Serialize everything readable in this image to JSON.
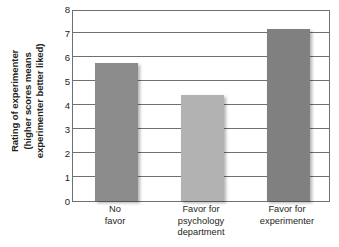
{
  "chart_data": {
    "type": "bar",
    "title": "",
    "xlabel": "",
    "ylabel": "Rating of experimenter (higher scores means experimenter better liked)",
    "ylabel_lines": [
      "Rating of experimenter",
      "(higher scores means",
      "experimenter better liked)"
    ],
    "categories": [
      "No favor",
      "Favor for psychology department",
      "Favor for experimenter"
    ],
    "category_lines": [
      [
        "No",
        "favor"
      ],
      [
        "Favor for",
        "psychology",
        "department"
      ],
      [
        "Favor for",
        "experimenter"
      ]
    ],
    "values": [
      5.75,
      4.4,
      7.15
    ],
    "ylim": [
      0,
      8
    ],
    "ytick_labels": [
      "8",
      "7",
      "6",
      "5",
      "4",
      "3",
      "2",
      "1",
      "0"
    ],
    "ytick_values": [
      8,
      7,
      6,
      5,
      4,
      3,
      2,
      1,
      0
    ],
    "grid": true,
    "legend": "none",
    "bar_colors": [
      "#8c8c8c",
      "#b2b2b2",
      "#808080"
    ],
    "axis_color": "#6f7072",
    "background": "#ffffff"
  }
}
